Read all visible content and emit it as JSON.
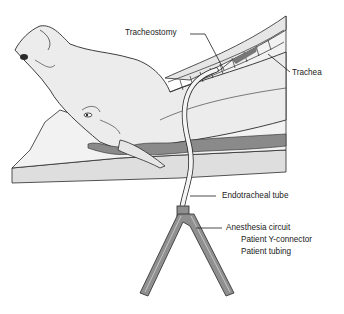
{
  "diagram": {
    "colors": {
      "outline": "#2a2a2a",
      "body_fill": "#ececec",
      "table_fill": "#dedede",
      "shadow_fill": "#8a8a8a",
      "tube_fill": "#f4f4f4",
      "connector_fill": "#8f8f8f",
      "label_text": "#222222"
    }
  },
  "labels": {
    "tracheostomy": "Tracheostomy",
    "trachea": "Trachea",
    "endotracheal_tube": "Endotracheal tube",
    "anesthesia_circuit": "Anesthesia circuit",
    "patient_y_connector": "Patient Y-connector",
    "patient_tubing": "Patient tubing"
  }
}
